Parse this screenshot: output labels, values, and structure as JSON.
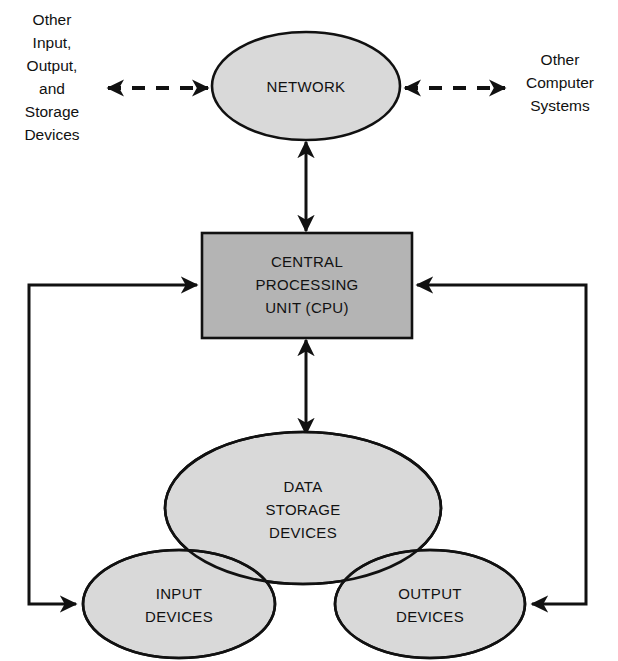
{
  "diagram": {
    "style": {
      "background": "#ffffff",
      "outline_color": "#111111",
      "ellipse_fill": "#d9d9d9",
      "box_fill": "#b4b4b4",
      "text_color": "#111111"
    },
    "nodes": [
      {
        "id": "network",
        "shape": "ellipse",
        "label": "NETWORK",
        "lines": [
          "NETWORK"
        ],
        "cx": 306,
        "cy": 86,
        "rx": 94,
        "ry": 54
      },
      {
        "id": "cpu",
        "shape": "rectangle",
        "label": "CENTRAL PROCESSING UNIT (CPU)",
        "lines": [
          "CENTRAL",
          "PROCESSING",
          "UNIT (CPU)"
        ],
        "x": 202,
        "y": 233,
        "width": 210,
        "height": 105
      },
      {
        "id": "data-storage-devices",
        "shape": "ellipse",
        "label": "DATA STORAGE DEVICES",
        "lines": [
          "DATA",
          "STORAGE",
          "DEVICES"
        ],
        "cx": 303,
        "cy": 508,
        "rx": 138,
        "ry": 76
      },
      {
        "id": "input-devices",
        "shape": "ellipse",
        "label": "INPUT DEVICES",
        "lines": [
          "INPUT",
          "DEVICES"
        ],
        "cx": 179,
        "cy": 604,
        "rx": 96,
        "ry": 54
      },
      {
        "id": "output-devices",
        "shape": "ellipse",
        "label": "OUTPUT DEVICES",
        "lines": [
          "OUTPUT",
          "DEVICES"
        ],
        "cx": 430,
        "cy": 604,
        "rx": 95,
        "ry": 54
      }
    ],
    "external_labels": [
      {
        "id": "other-io-storage",
        "lines": [
          "Other",
          "Input,",
          "Output,",
          "and",
          "Storage",
          "Devices"
        ],
        "text": "Other Input, Output, and Storage Devices",
        "x": 52,
        "y": 20,
        "align": "center"
      },
      {
        "id": "other-computer-systems",
        "lines": [
          "Other",
          "Computer",
          "Systems"
        ],
        "text": "Other Computer Systems",
        "x": 560,
        "y": 58,
        "align": "center"
      }
    ],
    "connections": [
      {
        "id": "network-to-other-io",
        "from": "other-io-storage",
        "to": "network",
        "style": "dashed",
        "direction": "bidirectional"
      },
      {
        "id": "network-to-other-systems",
        "from": "network",
        "to": "other-computer-systems",
        "style": "dashed",
        "direction": "bidirectional"
      },
      {
        "id": "network-to-cpu",
        "from": "network",
        "to": "cpu",
        "style": "solid",
        "direction": "bidirectional"
      },
      {
        "id": "cpu-to-data-storage",
        "from": "cpu",
        "to": "data-storage-devices",
        "style": "solid",
        "direction": "bidirectional"
      },
      {
        "id": "input-loop",
        "from": "cpu",
        "to": "input-devices",
        "style": "solid",
        "direction": "bidirectional-loop-left"
      },
      {
        "id": "output-loop",
        "from": "cpu",
        "to": "output-devices",
        "style": "solid",
        "direction": "bidirectional-loop-right"
      }
    ]
  }
}
